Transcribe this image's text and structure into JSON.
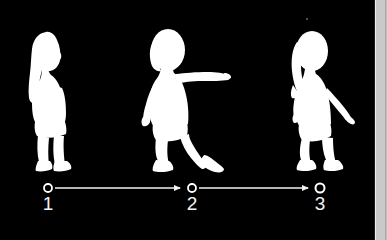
{
  "canvas": {
    "width": 387,
    "height": 240,
    "background_color": "#000000",
    "silhouette_color": "#ffffff"
  },
  "scene": {
    "name": "child-walking-sequence",
    "description": "Three white child silhouettes in sequence above a numbered timeline arrow",
    "figures": [
      {
        "id": "figure-1",
        "pose_label": "standing",
        "facing": "right",
        "step_number": "1"
      },
      {
        "id": "figure-2",
        "pose_label": "walking-arm-extended",
        "facing": "right",
        "step_number": "2"
      },
      {
        "id": "figure-3",
        "pose_label": "walking-arm-down",
        "facing": "right",
        "step_number": "3"
      }
    ]
  },
  "timeline": {
    "name": "step-timeline",
    "line_color": "#f2f2f2",
    "node_color": "#ffffff",
    "nodes": [
      {
        "label": "1",
        "cx": 48
      },
      {
        "label": "2",
        "cx": 192
      },
      {
        "label": "3",
        "cx": 320
      }
    ],
    "arrows": [
      {
        "from": "1",
        "to": "2",
        "direction": "right"
      },
      {
        "from": "2",
        "to": "3",
        "direction": "right"
      }
    ]
  },
  "scrollbar": {
    "name": "vertical-scrollbar",
    "orientation": "vertical",
    "track_color": "#cfcfcf",
    "thumb_color": "#c9c9c9",
    "position": "right-edge"
  },
  "artifacts": {
    "speck": {
      "name": "image-speck",
      "color": "#6a6a6a"
    }
  }
}
